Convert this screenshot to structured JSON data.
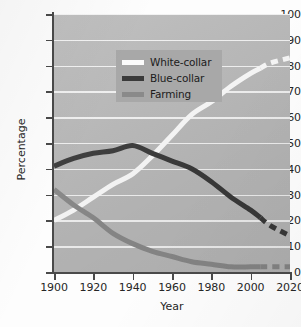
{
  "chart_data": {
    "type": "line",
    "title": "",
    "xlabel": "Year",
    "ylabel": "Percentage",
    "xlim": [
      1900,
      2020
    ],
    "ylim": [
      0,
      100
    ],
    "xticks": [
      1900,
      1920,
      1940,
      1960,
      1980,
      2000,
      2020
    ],
    "yticks": [
      0,
      10,
      20,
      30,
      40,
      50,
      60,
      70,
      80,
      90,
      100
    ],
    "grid": "horizontal",
    "legend_position": "upper-left-inside",
    "x": [
      1900,
      1910,
      1920,
      1930,
      1940,
      1950,
      1960,
      1970,
      1980,
      1990,
      2000,
      2005,
      2010,
      2020
    ],
    "series": [
      {
        "name": "White-collar",
        "color": "#fbfbfb",
        "values": [
          20,
          24,
          29,
          34,
          38,
          45,
          53,
          61,
          66,
          72,
          77,
          79,
          81,
          83
        ],
        "projection_starts_at": 2005,
        "projection_style": "dashed"
      },
      {
        "name": "Blue-collar",
        "color": "#3a3a3a",
        "values": [
          41,
          44,
          46,
          47,
          49,
          46,
          43,
          40,
          35,
          29,
          24,
          21,
          18,
          14
        ],
        "projection_starts_at": 2005,
        "projection_style": "dashed"
      },
      {
        "name": "Farming",
        "color": "#8a8a8a",
        "values": [
          32,
          26,
          21,
          15,
          11,
          8,
          6,
          4,
          3,
          2,
          2,
          2,
          2,
          2
        ],
        "projection_starts_at": 2005,
        "projection_style": "dashed"
      }
    ]
  },
  "axes": {
    "y_tick_labels": [
      "0",
      "10",
      "20",
      "30",
      "40",
      "50",
      "60",
      "70",
      "80",
      "90",
      "100"
    ],
    "x_tick_labels": [
      "1900",
      "1920",
      "1940",
      "1960",
      "1980",
      "2000",
      "2020"
    ],
    "y_axis_title": "Percentage",
    "x_axis_title": "Year"
  },
  "legend": {
    "entries": [
      {
        "label": "White-collar",
        "color": "#fbfbfb"
      },
      {
        "label": "Blue-collar",
        "color": "#3a3a3a"
      },
      {
        "label": "Farming",
        "color": "#8a8a8a"
      }
    ]
  },
  "colors": {
    "plot_background": "#b9b9b9",
    "page_background": "#fdfdfd",
    "gridline": "#f3f3f3",
    "axis": "#4a4a4a",
    "legend_background": "#a8a8a8",
    "text": "#262626"
  }
}
